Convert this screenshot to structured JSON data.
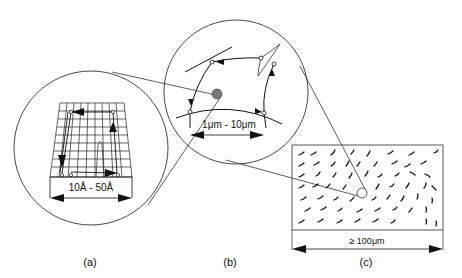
{
  "figure": {
    "panels": [
      {
        "id": "a",
        "label": "(a)",
        "scale": "10Å - 50Å",
        "description": "atomic-scale lattice grid with dislocation loop"
      },
      {
        "id": "b",
        "label": "(b)",
        "scale": "1μm - 10μm",
        "description": "dislocation network with nodes"
      },
      {
        "id": "c",
        "label": "(c)",
        "scale": "≥ 100μm",
        "description": "macroscopic field of dislocation segments"
      }
    ]
  }
}
